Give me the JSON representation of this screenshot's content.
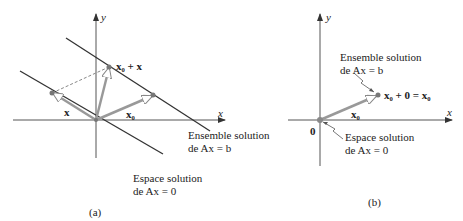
{
  "panel_a": {
    "caption": "(a)",
    "axis_x": "x",
    "axis_y": "y",
    "vec_x0_plus_x": "x₀ + x",
    "vec_x": "x",
    "vec_x0": "x₀",
    "solution_set_line1": "Ensemble solution",
    "solution_set_line2": "de Ax = b",
    "null_space_line1": "Espace solution",
    "null_space_line2": "de Ax = 0"
  },
  "panel_b": {
    "caption": "(b)",
    "axis_x": "x",
    "axis_y": "y",
    "origin": "0",
    "point_label": "x₀ + 0 = x₀",
    "vec_x0": "x₀",
    "solution_set_line1": "Ensemble solution",
    "solution_set_line2": "de Ax = b",
    "null_space_line1": "Espace solution",
    "null_space_line2": "de Ax = 0"
  },
  "colors": {
    "line": "#333333",
    "vector": "#888888",
    "axis": "#555555"
  }
}
